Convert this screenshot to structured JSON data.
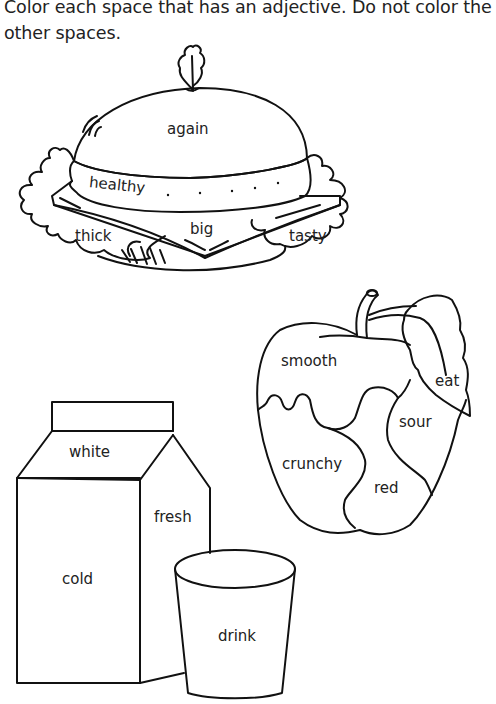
{
  "instructions": "Color each space that has an adjective. Do not color the other spaces.",
  "sandwich": {
    "words": {
      "bun_top": "again",
      "patty": "healthy",
      "lettuce_left": "thick",
      "cheese": "big",
      "lettuce_right": "tasty"
    }
  },
  "apple": {
    "words": {
      "top": "smooth",
      "leaf": "eat",
      "right": "sour",
      "left": "crunchy",
      "bottom": "red"
    }
  },
  "milk_carton": {
    "words": {
      "top": "white",
      "side": "fresh",
      "front": "cold"
    }
  },
  "glass": {
    "words": {
      "body": "drink"
    }
  }
}
